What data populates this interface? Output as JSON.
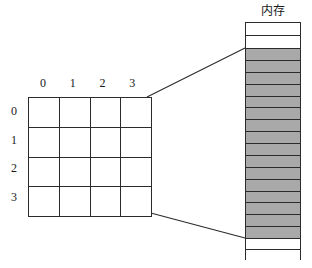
{
  "figure": {
    "kind": "array-memory-mapping-diagram",
    "background_color": "#ffffff",
    "line_color": "#2b2b2b"
  },
  "array": {
    "name": "two-dimensional-array",
    "rows": 4,
    "cols": 4,
    "col_labels": [
      "0",
      "1",
      "2",
      "3"
    ],
    "row_labels": [
      "0",
      "1",
      "2",
      "3"
    ],
    "cells": [
      [
        "",
        "",
        "",
        ""
      ],
      [
        "",
        "",
        "",
        ""
      ],
      [
        "",
        "",
        "",
        ""
      ],
      [
        "",
        "",
        "",
        ""
      ]
    ]
  },
  "memory": {
    "title": "内存",
    "total_slots": 20,
    "used_color": "#a9a9a9",
    "free_color": "#ffffff",
    "slots": [
      {
        "index": 0,
        "state": "free"
      },
      {
        "index": 1,
        "state": "free"
      },
      {
        "index": 2,
        "state": "used"
      },
      {
        "index": 3,
        "state": "used"
      },
      {
        "index": 4,
        "state": "used"
      },
      {
        "index": 5,
        "state": "used"
      },
      {
        "index": 6,
        "state": "used"
      },
      {
        "index": 7,
        "state": "used"
      },
      {
        "index": 8,
        "state": "used"
      },
      {
        "index": 9,
        "state": "used"
      },
      {
        "index": 10,
        "state": "used"
      },
      {
        "index": 11,
        "state": "used"
      },
      {
        "index": 12,
        "state": "used"
      },
      {
        "index": 13,
        "state": "used"
      },
      {
        "index": 14,
        "state": "used"
      },
      {
        "index": 15,
        "state": "used"
      },
      {
        "index": 16,
        "state": "used"
      },
      {
        "index": 17,
        "state": "used"
      },
      {
        "index": 18,
        "state": "free"
      },
      {
        "index": 19,
        "state": "free"
      }
    ]
  },
  "connectors": [
    {
      "name": "top-connector",
      "from": [
        147,
        97
      ],
      "to": [
        245,
        48
      ]
    },
    {
      "name": "bottom-connector",
      "from": [
        147,
        212
      ],
      "to": [
        245,
        238
      ]
    }
  ]
}
